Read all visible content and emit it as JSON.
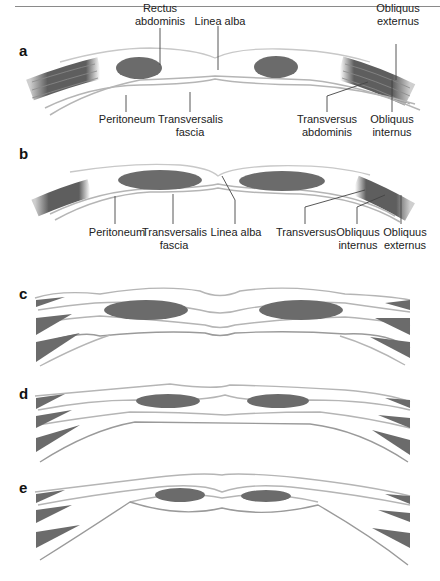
{
  "figure": {
    "panels": [
      {
        "id": "a",
        "label": "a",
        "labels": {
          "rectus": "Rectus\nabdominis",
          "linea": "Linea alba",
          "ext": "Obliquus\nexternus",
          "perit": "Peritoneum",
          "transf": "Transversalis\nfascia",
          "transab": "Transversus\nabdominis",
          "int": "Obliquus\ninternus"
        }
      },
      {
        "id": "b",
        "label": "b",
        "labels": {
          "perit": "Peritoneum",
          "transf": "Transversalis\nfascia",
          "linea": "Linea alba",
          "transv": "Transversus",
          "int": "Obliquus\ninternus",
          "ext": "Obliquus\nexternus"
        }
      },
      {
        "id": "c",
        "label": "c"
      },
      {
        "id": "d",
        "label": "d"
      },
      {
        "id": "e",
        "label": "e"
      }
    ]
  },
  "colors": {
    "muscle": "#6b6b6b",
    "line": "#b5b5b5",
    "leader": "#444444"
  }
}
